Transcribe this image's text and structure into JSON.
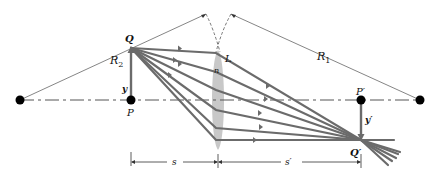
{
  "diagram": {
    "labels": {
      "R2": "R",
      "R2_sub": "2",
      "R1": "R",
      "R1_sub": "1",
      "Q": "Q",
      "L": "L",
      "n": "n",
      "y": "y",
      "P": "P",
      "P_prime": "P′",
      "y_prime": "y′",
      "Q_prime": "Q′",
      "s": "s",
      "s_prime": "s′"
    },
    "colors": {
      "ray": "#6b6b6b",
      "lens": "#c8c8c8",
      "axis": "#555555",
      "point": "#000000"
    },
    "points": {
      "center_left": [
        20,
        100
      ],
      "P": [
        131,
        100
      ],
      "Q": [
        131,
        48
      ],
      "lens_center_x": 218,
      "P_prime": [
        361,
        100
      ],
      "Q_prime": [
        361,
        140
      ],
      "center_right": [
        420,
        100
      ]
    }
  }
}
